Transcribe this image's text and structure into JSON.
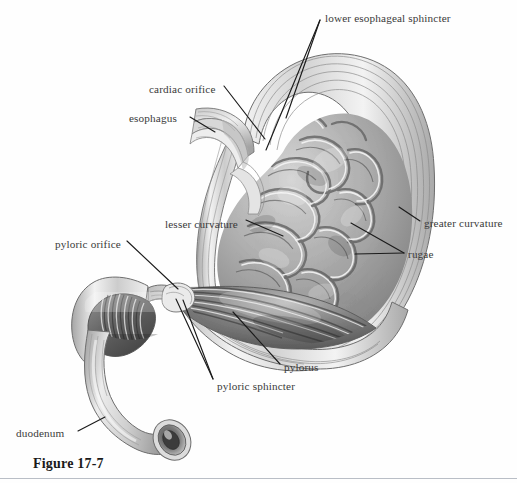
{
  "figure": {
    "caption": "Figure 17-7",
    "domain_note": "grayscale anatomical illustration of a stomach in coronal cross-section, cut open to reveal internal mucosal folds",
    "background_color": "#ffffff",
    "ink_color": "#3a3a3a",
    "rule_color": "#b9bec6"
  },
  "labels": [
    {
      "id": "lower-esophageal-sphincter",
      "text": "lower esophageal sphincter",
      "x": 325,
      "y": 13,
      "align": "left"
    },
    {
      "id": "cardiac-orifice",
      "text": "cardiac orifice",
      "x": 149,
      "y": 84,
      "align": "left"
    },
    {
      "id": "esophagus",
      "text": "esophagus",
      "x": 129,
      "y": 113,
      "align": "left"
    },
    {
      "id": "lesser-curvature",
      "text": "lesser curvature",
      "x": 165,
      "y": 219,
      "align": "left"
    },
    {
      "id": "greater-curvature",
      "text": "greater curvature",
      "x": 424,
      "y": 218,
      "align": "left"
    },
    {
      "id": "rugae",
      "text": "rugae",
      "x": 408,
      "y": 250,
      "align": "left"
    },
    {
      "id": "pyloric-orifice",
      "text": "pyloric orifice",
      "x": 55,
      "y": 239,
      "align": "left"
    },
    {
      "id": "pylorus",
      "text": "pylorus",
      "x": 284,
      "y": 363,
      "align": "left"
    },
    {
      "id": "pyloric-sphincter",
      "text": "pyloric sphincter",
      "x": 217,
      "y": 382,
      "align": "left"
    },
    {
      "id": "duodenum",
      "text": "duodenum",
      "x": 16,
      "y": 428,
      "align": "left"
    }
  ],
  "leader_lines": [
    {
      "for": "lower-esophageal-sphincter",
      "points": "320,20 266,150"
    },
    {
      "for": "lower-esophageal-sphincter-2",
      "points": "320,20 284,120"
    },
    {
      "for": "cardiac-orifice",
      "points": "224,86 264,136"
    },
    {
      "for": "esophagus",
      "points": "189,117 214,131"
    },
    {
      "for": "lesser-curvature",
      "points": "246,220 282,234"
    },
    {
      "for": "greater-curvature",
      "points": "420,221 400,208"
    },
    {
      "for": "rugae",
      "points": "404,253 352,224"
    },
    {
      "for": "rugae-2",
      "points": "404,253 355,253"
    },
    {
      "for": "pyloric-orifice",
      "points": "127,241 177,288"
    },
    {
      "for": "pylorus",
      "points": "280,366 232,313"
    },
    {
      "for": "pyloric-sphincter",
      "points": "213,381 176,300"
    },
    {
      "for": "pyloric-sphincter-2",
      "points": "213,381 182,301"
    },
    {
      "for": "duodenum",
      "points": "78,431 104,418"
    }
  ],
  "structures": [
    {
      "id": "stomach-body",
      "name": "stomach body and fundus"
    },
    {
      "id": "esophagus-tube",
      "name": "esophagus"
    },
    {
      "id": "rugae-folds",
      "name": "rugae (gastric mucosal folds)"
    },
    {
      "id": "pyloric-antrum",
      "name": "pyloric antrum"
    },
    {
      "id": "pyloric-canal",
      "name": "pyloric canal and sphincter"
    },
    {
      "id": "duodenum-tube",
      "name": "duodenum"
    },
    {
      "id": "duodenum-lumen",
      "name": "cut duodenal lumen"
    }
  ],
  "palette": {
    "wall_outline": "#6f6f6f",
    "wall_light": "#f2f2f2",
    "wall_mid": "#cfcfcf",
    "mucosa_light": "#d9d9d9",
    "mucosa_mid": "#a8a8a8",
    "mucosa_dark": "#6d6d6d",
    "mucosa_deep": "#4a4a4a",
    "highlight": "#ffffff"
  }
}
